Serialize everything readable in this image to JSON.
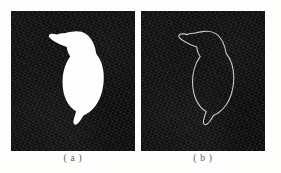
{
  "figure": {
    "type": "two-panel-image-figure",
    "background_color": "#fdfdfc",
    "panel_background_color": "#0a0a0a",
    "shape_fill_color": "#fefefe",
    "contour_stroke_color": "#c8c8c0"
  },
  "panels": [
    {
      "id": "a",
      "caption": "( a )",
      "render_mode": "filled-silhouette",
      "description": "white binary silhouette mask of a kingfisher on dark noisy background"
    },
    {
      "id": "b",
      "caption": "( b )",
      "render_mode": "contour-outline",
      "description": "extracted thin contour outline of the same kingfisher shape on dark noisy background"
    }
  ],
  "shape": {
    "name": "kingfisher-outline",
    "viewbox": "0 0 124 140",
    "path": "M 46.5 23.6 C 48.6 22.4 51.0 22.1 53.3 22.3 C 56.6 21.2 60.0 20.6 63.4 20.4 C 67.4 20.1 71.6 20.7 75.0 22.9 C 78.2 24.9 80.3 28.0 81.9 31.3 C 83.6 34.9 84.6 38.8 85.3 42.7 C 86.8 44.7 88.2 46.9 89.3 49.2 C 90.9 52.5 91.8 56.2 92.3 59.8 C 92.9 63.9 92.9 68.1 92.5 72.2 C 92.1 76.2 91.3 80.2 90.0 84.0 C 88.8 87.6 87.1 91.1 84.9 94.2 C 83.0 96.9 80.7 99.3 78.1 101.3 C 76.4 102.6 74.5 103.7 72.5 104.4 C 71.4 106.3 70.3 108.2 69.0 110.0 C 68.2 111.1 67.3 112.2 66.2 113.0 C 65.5 113.5 64.6 113.9 63.8 113.6 C 63.0 113.3 62.6 112.4 62.5 111.6 C 62.3 110.0 62.7 108.4 63.1 106.9 C 63.7 104.7 64.5 102.6 65.1 100.4 C 63.0 99.2 61.1 97.6 59.5 95.8 C 57.3 93.3 55.6 90.4 54.4 87.3 C 53.0 83.8 52.2 80.1 51.8 76.4 C 51.4 72.5 51.4 68.5 51.9 64.6 C 52.4 60.6 53.4 56.6 55.0 52.9 C 56.1 50.3 57.5 47.8 59.2 45.6 C 58.3 44.2 57.5 42.7 56.9 41.1 C 56.3 39.5 55.9 37.8 55.8 36.1 C 53.6 35.4 51.4 34.6 49.3 33.6 C 46.9 32.5 44.5 31.3 42.3 29.8 C 41.0 28.9 39.7 28.0 38.7 26.8 C 38.2 26.2 37.7 25.5 37.8 24.7 C 37.9 24.0 38.5 23.5 39.1 23.2 C 40.3 22.7 41.7 22.8 43.0 22.9 C 44.2 23.0 45.4 23.3 46.5 23.6 Z",
    "contour_stroke_width": 1.1
  }
}
